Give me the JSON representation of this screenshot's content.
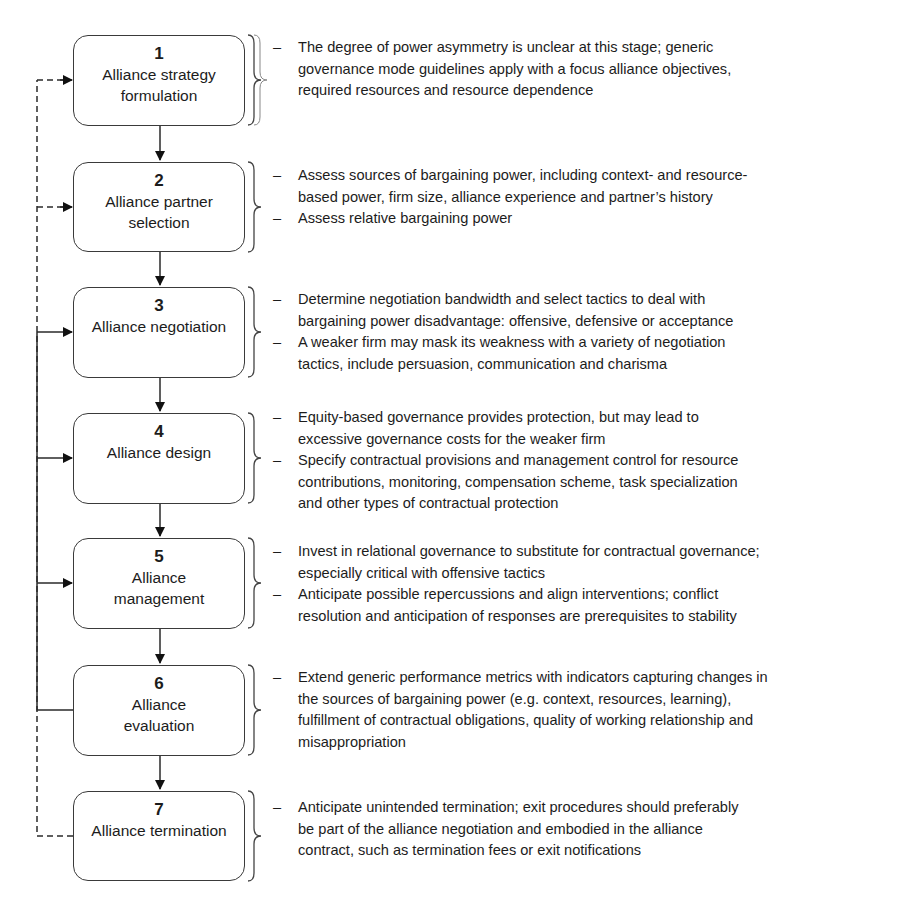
{
  "diagram": {
    "type": "process-flow",
    "stages": [
      {
        "number": "1",
        "label_lines": [
          "Alliance strategy",
          "formulation"
        ],
        "notes": [
          [
            "The degree of power asymmetry is unclear at this stage; generic",
            "governance mode guidelines apply with a focus alliance objectives,",
            "required resources and resource dependence"
          ]
        ]
      },
      {
        "number": "2",
        "label_lines": [
          "Alliance partner",
          "selection"
        ],
        "notes": [
          [
            "Assess sources of bargaining power, including context- and resource-",
            "based power, firm size, alliance experience and partner’s history"
          ],
          [
            "Assess relative bargaining power"
          ]
        ]
      },
      {
        "number": "3",
        "label_lines": [
          "Alliance negotiation"
        ],
        "notes": [
          [
            "Determine negotiation bandwidth and select tactics to deal with",
            "bargaining power disadvantage: offensive, defensive or acceptance"
          ],
          [
            "A weaker firm may mask its weakness with a variety of negotiation",
            "tactics, include persuasion, communication and charisma"
          ]
        ]
      },
      {
        "number": "4",
        "label_lines": [
          "Alliance design"
        ],
        "notes": [
          [
            "Equity-based governance provides protection, but may lead to",
            "excessive governance costs for the weaker firm"
          ],
          [
            "Specify contractual provisions and management control for resource",
            "contributions, monitoring, compensation scheme, task specialization",
            "and other types of contractual protection"
          ]
        ]
      },
      {
        "number": "5",
        "label_lines": [
          "Alliance",
          "management"
        ],
        "notes": [
          [
            "Invest in relational governance to substitute for contractual governance;",
            "especially critical with offensive tactics"
          ],
          [
            "Anticipate possible repercussions and align interventions; conflict",
            "resolution and anticipation of responses are prerequisites to stability"
          ]
        ]
      },
      {
        "number": "6",
        "label_lines": [
          "Alliance",
          "evaluation"
        ],
        "notes": [
          [
            "Extend generic performance metrics with indicators capturing changes in",
            "the sources of bargaining power (e.g. context, resources, learning),",
            "fulfillment of contractual obligations, quality of working relationship and",
            "misappropriation"
          ]
        ]
      },
      {
        "number": "7",
        "label_lines": [
          "Alliance termination"
        ],
        "notes": [
          [
            "Anticipate unintended termination; exit procedures should preferably",
            "be part of the alliance negotiation and embodied in the alliance",
            "contract, such as termination fees or exit notifications"
          ]
        ]
      }
    ],
    "feedback": {
      "solid_from_stage": "6",
      "solid_to_stages": [
        "3",
        "4",
        "5"
      ],
      "dashed_from_stage": "7",
      "dashed_to_stages": [
        "1",
        "2"
      ]
    },
    "note_bullet": "–"
  }
}
